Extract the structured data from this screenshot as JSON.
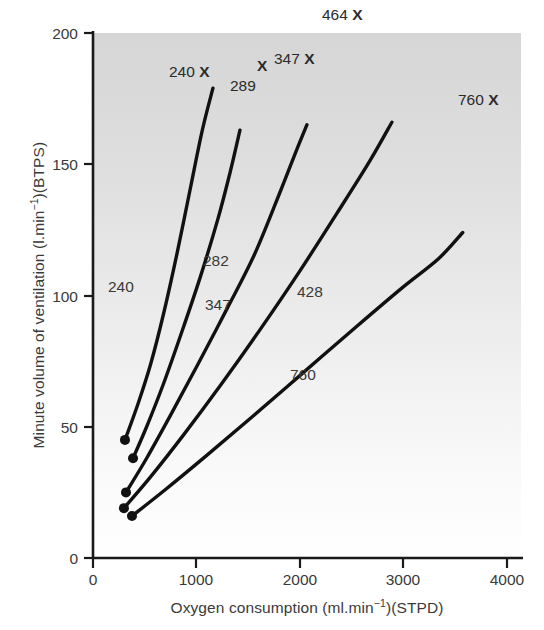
{
  "chart_data": {
    "type": "line",
    "title": "",
    "xlabel": "Oxygen consumption (ml.min⁻¹)(STPD)",
    "ylabel": "Minute volume of ventilation (l.min⁻¹)(BTPS)",
    "xlim": [
      0,
      4150
    ],
    "ylim": [
      0,
      200
    ],
    "xticks": [
      0,
      1000,
      2000,
      3000,
      4000
    ],
    "xtick_labels": [
      "0",
      "1000",
      "2000",
      "3000",
      "4000"
    ],
    "yticks": [
      0,
      50,
      100,
      150,
      200
    ],
    "ytick_labels": [
      "0",
      "50",
      "100",
      "150",
      "200"
    ],
    "grid": false,
    "legend": "none",
    "background": "vertical grey gradient, dark at top fading to white at bottom",
    "series": [
      {
        "name": "240",
        "label": "240",
        "endpoint_marker_label": "240 X",
        "points": [
          [
            310,
            45
          ],
          [
            430,
            58
          ],
          [
            560,
            74
          ],
          [
            690,
            94
          ],
          [
            820,
            117
          ],
          [
            950,
            142
          ],
          [
            1060,
            163
          ],
          [
            1163,
            179
          ]
        ]
      },
      {
        "name": "282",
        "label": "282",
        "endpoint_marker_label": "289",
        "points": [
          [
            388,
            38
          ],
          [
            520,
            50
          ],
          [
            680,
            66
          ],
          [
            860,
            86
          ],
          [
            1040,
            107
          ],
          [
            1210,
            129
          ],
          [
            1330,
            147
          ],
          [
            1425,
            163
          ]
        ]
      },
      {
        "name": "347",
        "label": "347",
        "endpoint_marker_label": "347 X",
        "points": [
          [
            320,
            25
          ],
          [
            520,
            38
          ],
          [
            760,
            55
          ],
          [
            1020,
            74
          ],
          [
            1300,
            95
          ],
          [
            1570,
            116
          ],
          [
            1820,
            140
          ],
          [
            1970,
            155
          ],
          [
            2074,
            165
          ]
        ]
      },
      {
        "name": "428",
        "label": "428",
        "endpoint_marker_label": "464 X",
        "points": [
          [
            300,
            19
          ],
          [
            560,
            31
          ],
          [
            880,
            47
          ],
          [
            1240,
            66
          ],
          [
            1620,
            87
          ],
          [
            2000,
            109
          ],
          [
            2360,
            131
          ],
          [
            2680,
            151
          ],
          [
            2898,
            166
          ]
        ]
      },
      {
        "name": "760",
        "label": "760",
        "endpoint_marker_label": "760 X",
        "points": [
          [
            378,
            16
          ],
          [
            700,
            26
          ],
          [
            1100,
            39
          ],
          [
            1550,
            54
          ],
          [
            2050,
            71
          ],
          [
            2550,
            88
          ],
          [
            3000,
            103
          ],
          [
            3350,
            114
          ],
          [
            3585,
            124
          ]
        ]
      }
    ],
    "start_points": [
      {
        "series": "240",
        "x": 310,
        "y": 45
      },
      {
        "series": "282",
        "x": 388,
        "y": 38
      },
      {
        "series": "347",
        "x": 320,
        "y": 25
      },
      {
        "series": "428",
        "x": 300,
        "y": 19
      },
      {
        "series": "760",
        "x": 378,
        "y": 16
      }
    ],
    "curve_labels": [
      {
        "text": "240",
        "x": 250,
        "y": 400
      },
      {
        "text": "282",
        "x": 330,
        "y": 320
      },
      {
        "text": "347",
        "x": 390,
        "y": 232
      },
      {
        "text": "428",
        "x": 345,
        "y": 112
      },
      {
        "text": "760",
        "x": 300,
        "y": 385
      }
    ],
    "annotations": [
      {
        "text": "240",
        "marker": "X",
        "px": 171,
        "py": 62
      },
      {
        "text": "289",
        "marker": "X",
        "px": 232,
        "py": 62
      },
      {
        "text": "347",
        "marker": "X",
        "px": 272,
        "py": 48
      },
      {
        "text": "464",
        "marker": "X",
        "px": 318,
        "py": 4
      },
      {
        "text": "760",
        "marker": "X",
        "px": 457,
        "py": 90
      }
    ],
    "colors": {
      "curve": "#111111",
      "axis": "#1a1a1a",
      "text": "#3a3a3a",
      "plot_bg_top": "#d9d9d9",
      "plot_bg_bottom": "#ffffff",
      "page_bg": "#ffffff"
    }
  },
  "axis": {
    "xlabel_text": "Oxygen consumption (ml.min",
    "xlabel_sup": "−1",
    "xlabel_tail": ")(STPD)",
    "ylabel_text": "Minute volume of ventilation (l.min",
    "ylabel_sup": "−1",
    "ylabel_tail": ")(BTPS)"
  }
}
